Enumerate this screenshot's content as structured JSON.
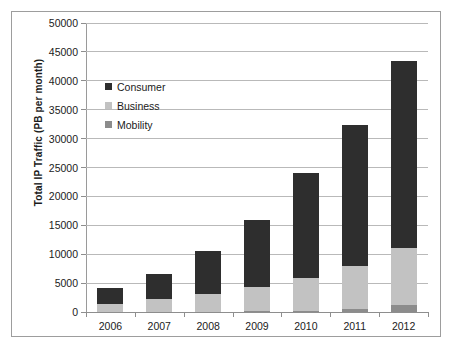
{
  "chart_data": {
    "type": "bar",
    "stacked": true,
    "title": "",
    "xlabel": "",
    "ylabel": "Total IP Traffic (PB per month)",
    "categories": [
      "2006",
      "2007",
      "2008",
      "2009",
      "2010",
      "2011",
      "2012"
    ],
    "series": [
      {
        "name": "Mobility",
        "color": "#8c8c8c",
        "values": [
          10,
          20,
          40,
          90,
          200,
          500,
          1150
        ]
      },
      {
        "name": "Business",
        "color": "#c2c2c2",
        "values": [
          1450,
          2150,
          3050,
          4200,
          5700,
          7500,
          9900
        ]
      },
      {
        "name": "Consumer",
        "color": "#2e2e2e",
        "values": [
          2740,
          4430,
          7510,
          11710,
          18100,
          24400,
          32350
        ]
      }
    ],
    "totals": [
      4200,
      6600,
      10600,
      16000,
      24000,
      32400,
      43400
    ],
    "ylim": [
      0,
      50000
    ],
    "ytick_step": 5000,
    "yticks": [
      "0",
      "5000",
      "10000",
      "15000",
      "20000",
      "25000",
      "30000",
      "35000",
      "40000",
      "45000",
      "50000"
    ],
    "grid": true,
    "legend_position": "inside-upper-left",
    "legend": [
      {
        "label": "Consumer",
        "color": "#2e2e2e"
      },
      {
        "label": "Business",
        "color": "#c2c2c2"
      },
      {
        "label": "Mobility",
        "color": "#8c8c8c"
      }
    ]
  },
  "colors": {
    "consumer": "#2e2e2e",
    "business": "#c2c2c2",
    "mobility": "#8c8c8c",
    "gridline": "#b9b9b9",
    "axis": "#8e8e8e",
    "frame": "#9d9d9d",
    "text": "#1b1b1b"
  }
}
